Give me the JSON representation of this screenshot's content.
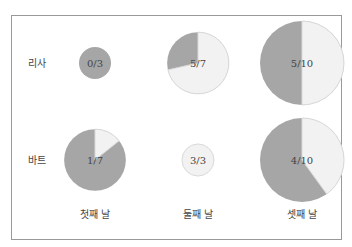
{
  "chart_data": {
    "type": "pie",
    "title": "",
    "layout": "grid of proportional pie charts, size scaled by denominator",
    "rows": [
      "리사",
      "바트"
    ],
    "columns": [
      "첫째 날",
      "둘째 날",
      "셋째 날"
    ],
    "cells": [
      {
        "row": "리사",
        "column": "첫째 날",
        "label": "0/3",
        "numerator": 0,
        "denominator": 3
      },
      {
        "row": "리사",
        "column": "둘째 날",
        "label": "5/7",
        "numerator": 5,
        "denominator": 7
      },
      {
        "row": "리사",
        "column": "셋째 날",
        "label": "5/10",
        "numerator": 5,
        "denominator": 10
      },
      {
        "row": "바트",
        "column": "첫째 날",
        "label": "1/7",
        "numerator": 1,
        "denominator": 7
      },
      {
        "row": "바트",
        "column": "둘째 날",
        "label": "3/3",
        "numerator": 3,
        "denominator": 3
      },
      {
        "row": "바트",
        "column": "셋째 날",
        "label": "4/10",
        "numerator": 4,
        "denominator": 10
      }
    ],
    "colors": {
      "numerator": "#f2f2f2",
      "remainder": "#a6a6a6",
      "stroke": "#d9d9d9",
      "frame": "#999999"
    },
    "legend": "none",
    "grid": false
  }
}
